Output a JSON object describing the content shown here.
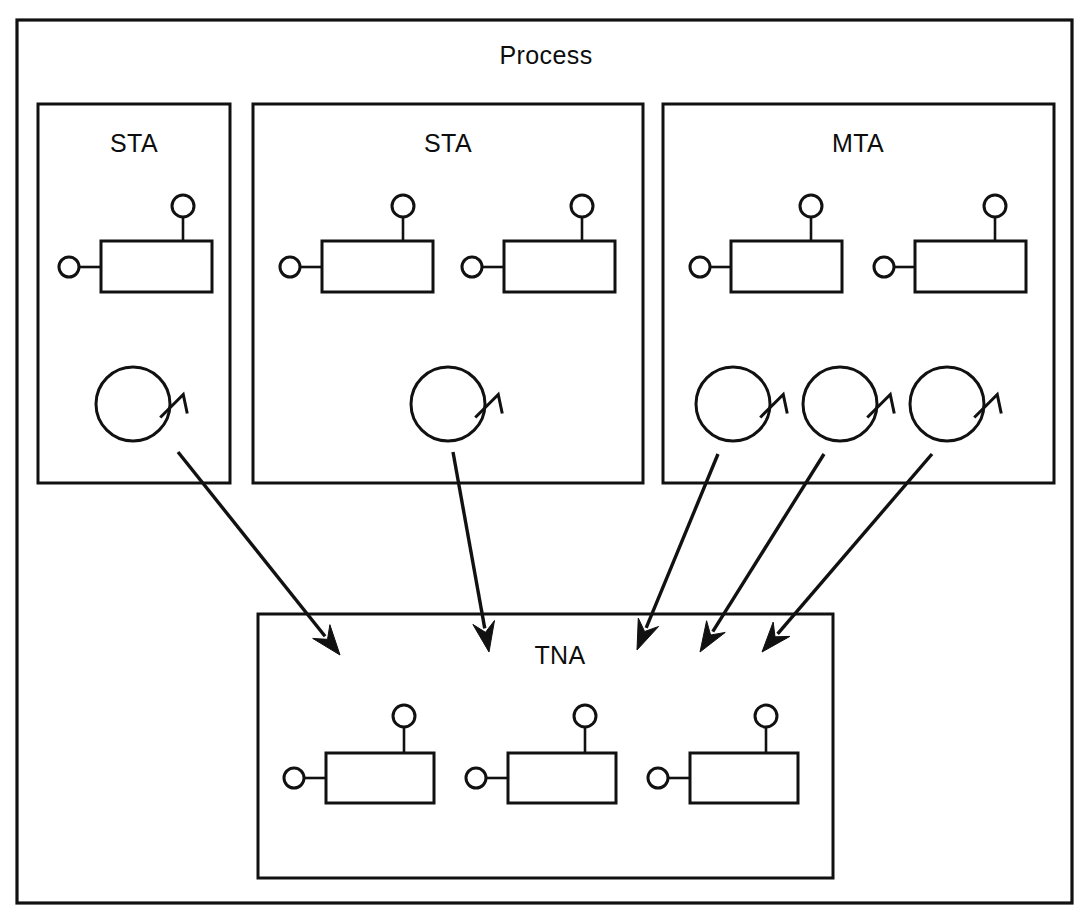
{
  "diagram": {
    "title": "Process",
    "kind": "component-and-thread-architecture-diagram",
    "canvas": {
      "width": 1091,
      "height": 919
    },
    "colors": {
      "stroke": "#111111",
      "fill": "#ffffff",
      "background": "#ffffff"
    },
    "outer": {
      "label": "Process",
      "label_x": 546,
      "label_y": 64,
      "x": 17,
      "y": 20,
      "w": 1055,
      "h": 883
    },
    "groups": [
      {
        "id": "sta-1",
        "label": "STA",
        "label_x": 134,
        "label_y": 152,
        "x": 38,
        "y": 104,
        "w": 192,
        "h": 379,
        "components": [
          {
            "id": "sta1-comp-1",
            "rect_x": 101,
            "rect_y": 241,
            "rect_w": 111,
            "rect_h": 51,
            "left_port_cx": 69,
            "left_port_cy": 267,
            "left_port_r": 10,
            "top_port_cx": 183,
            "top_port_cy": 206,
            "top_port_r": 11
          }
        ],
        "threads": [
          {
            "id": "sta1-thread-1",
            "cx": 133,
            "cy": 404,
            "r": 37
          }
        ]
      },
      {
        "id": "sta-2",
        "label": "STA",
        "label_x": 448,
        "label_y": 152,
        "x": 253,
        "y": 104,
        "w": 390,
        "h": 379,
        "components": [
          {
            "id": "sta2-comp-1",
            "rect_x": 322,
            "rect_y": 241,
            "rect_w": 111,
            "rect_h": 51,
            "left_port_cx": 290,
            "left_port_cy": 267,
            "left_port_r": 10,
            "top_port_cx": 403,
            "top_port_cy": 206,
            "top_port_r": 11
          },
          {
            "id": "sta2-comp-2",
            "rect_x": 504,
            "rect_y": 241,
            "rect_w": 111,
            "rect_h": 51,
            "left_port_cx": 472,
            "left_port_cy": 267,
            "left_port_r": 10,
            "top_port_cx": 582,
            "top_port_cy": 206,
            "top_port_r": 11
          }
        ],
        "threads": [
          {
            "id": "sta2-thread-1",
            "cx": 448,
            "cy": 404,
            "r": 37
          }
        ]
      },
      {
        "id": "mta-1",
        "label": "MTA",
        "label_x": 858,
        "label_y": 152,
        "x": 663,
        "y": 104,
        "w": 391,
        "h": 379,
        "components": [
          {
            "id": "mta-comp-1",
            "rect_x": 731,
            "rect_y": 241,
            "rect_w": 111,
            "rect_h": 51,
            "left_port_cx": 700,
            "left_port_cy": 267,
            "left_port_r": 10,
            "top_port_cx": 811,
            "top_port_cy": 206,
            "top_port_r": 11
          },
          {
            "id": "mta-comp-2",
            "rect_x": 915,
            "rect_y": 241,
            "rect_w": 111,
            "rect_h": 51,
            "left_port_cx": 884,
            "left_port_cy": 267,
            "left_port_r": 10,
            "top_port_cx": 995,
            "top_port_cy": 206,
            "top_port_r": 11
          }
        ],
        "threads": [
          {
            "id": "mta-thread-1",
            "cx": 733,
            "cy": 404,
            "r": 37
          },
          {
            "id": "mta-thread-2",
            "cx": 840,
            "cy": 404,
            "r": 37
          },
          {
            "id": "mta-thread-3",
            "cx": 947,
            "cy": 404,
            "r": 37
          }
        ]
      },
      {
        "id": "tna-1",
        "label": "TNA",
        "label_x": 560,
        "label_y": 664,
        "x": 258,
        "y": 614,
        "w": 575,
        "h": 264,
        "components": [
          {
            "id": "tna-comp-1",
            "rect_x": 326,
            "rect_y": 753,
            "rect_w": 108,
            "rect_h": 50,
            "left_port_cx": 294,
            "left_port_cy": 778,
            "left_port_r": 10,
            "top_port_cx": 404,
            "top_port_cy": 716,
            "top_port_r": 11
          },
          {
            "id": "tna-comp-2",
            "rect_x": 508,
            "rect_y": 753,
            "rect_w": 108,
            "rect_h": 50,
            "left_port_cx": 476,
            "left_port_cy": 778,
            "left_port_r": 10,
            "top_port_cx": 585,
            "top_port_cy": 716,
            "top_port_r": 11
          },
          {
            "id": "tna-comp-3",
            "rect_x": 690,
            "rect_y": 753,
            "rect_w": 108,
            "rect_h": 50,
            "left_port_cx": 658,
            "left_port_cy": 778,
            "left_port_r": 10,
            "top_port_cx": 766,
            "top_port_cy": 716,
            "top_port_r": 11
          }
        ],
        "threads": []
      }
    ],
    "flows": [
      {
        "id": "flow-sta1-to-tna",
        "from": "sta1-thread-1",
        "to": "tna-1",
        "x1": 178,
        "y1": 452,
        "x2": 340,
        "y2": 655
      },
      {
        "id": "flow-sta2-to-tna",
        "from": "sta2-thread-1",
        "to": "tna-1",
        "x1": 453,
        "y1": 452,
        "x2": 489,
        "y2": 652
      },
      {
        "id": "flow-mta1-to-tna",
        "from": "mta-thread-1",
        "to": "tna-1",
        "x1": 718,
        "y1": 454,
        "x2": 637,
        "y2": 650
      },
      {
        "id": "flow-mta2-to-tna",
        "from": "mta-thread-2",
        "to": "tna-1",
        "x1": 824,
        "y1": 454,
        "x2": 700,
        "y2": 652
      },
      {
        "id": "flow-mta3-to-tna",
        "from": "mta-thread-3",
        "to": "tna-1",
        "x1": 932,
        "y1": 454,
        "x2": 762,
        "y2": 652
      }
    ]
  }
}
